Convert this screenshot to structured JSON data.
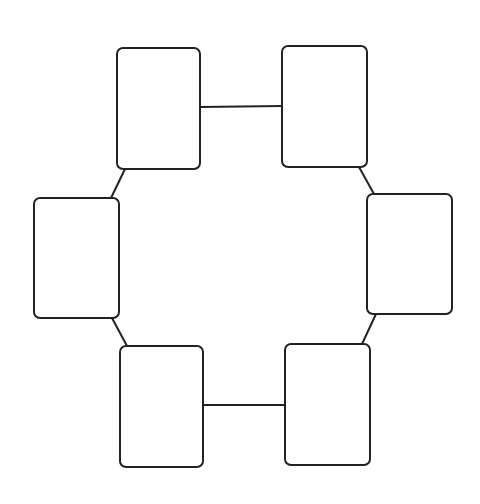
{
  "diagram": {
    "type": "ring-of-boxes",
    "background": "#ffffff",
    "stroke_color": "#222222",
    "nodes": [
      {
        "id": "top-left",
        "x": 117,
        "y": 48,
        "w": 83,
        "h": 121,
        "label": ""
      },
      {
        "id": "top-right",
        "x": 282,
        "y": 46,
        "w": 85,
        "h": 121,
        "label": ""
      },
      {
        "id": "middle-right",
        "x": 367,
        "y": 194,
        "w": 85,
        "h": 120,
        "label": ""
      },
      {
        "id": "bottom-right",
        "x": 285,
        "y": 344,
        "w": 85,
        "h": 121,
        "label": ""
      },
      {
        "id": "bottom-left",
        "x": 120,
        "y": 346,
        "w": 83,
        "h": 121,
        "label": ""
      },
      {
        "id": "middle-left",
        "x": 34,
        "y": 198,
        "w": 85,
        "h": 120,
        "label": ""
      }
    ],
    "edges": [
      {
        "from": "top-left",
        "to": "top-right",
        "x1": 200,
        "y1": 107,
        "x2": 282,
        "y2": 106
      },
      {
        "from": "top-right",
        "to": "middle-right",
        "x1": 359,
        "y1": 167,
        "x2": 374,
        "y2": 194
      },
      {
        "from": "middle-right",
        "to": "bottom-right",
        "x1": 376,
        "y1": 314,
        "x2": 362,
        "y2": 344
      },
      {
        "from": "bottom-right",
        "to": "bottom-left",
        "x1": 285,
        "y1": 405,
        "x2": 203,
        "y2": 405
      },
      {
        "from": "bottom-left",
        "to": "middle-left",
        "x1": 127,
        "y1": 346,
        "x2": 112,
        "y2": 318
      },
      {
        "from": "middle-left",
        "to": "top-left",
        "x1": 111,
        "y1": 198,
        "x2": 125,
        "y2": 169
      }
    ]
  }
}
